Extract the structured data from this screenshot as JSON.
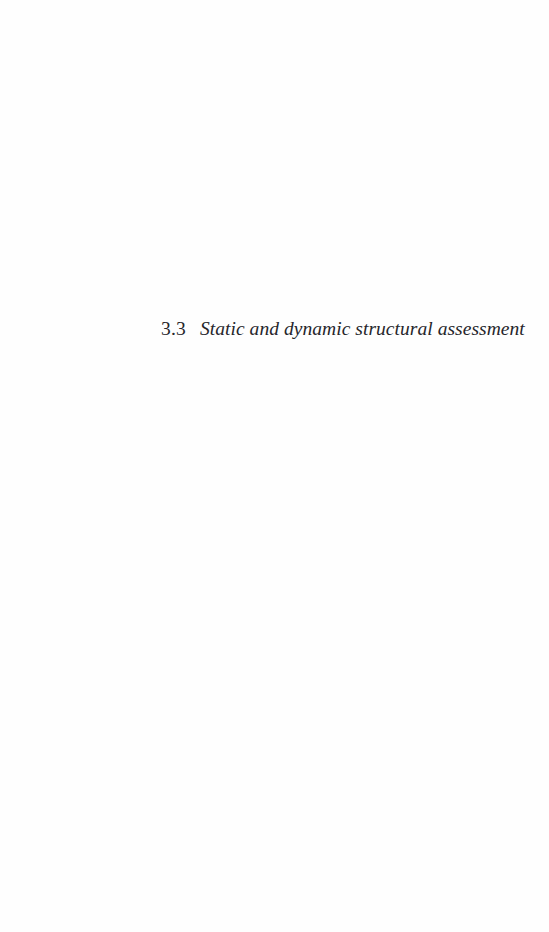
{
  "page": {
    "background_color": "#fefefe",
    "text_color": "#26262b",
    "width": 549,
    "height": 932
  },
  "header_residue": {
    "text": "· ·   · · ·   · ·   · · ·   · ·   · ·",
    "note": "faint cropped running-header remnant at top edge"
  },
  "heading": {
    "number": "3.3",
    "title": "Static and dynamic structural assessment"
  },
  "body": {
    "paragraphs": []
  }
}
